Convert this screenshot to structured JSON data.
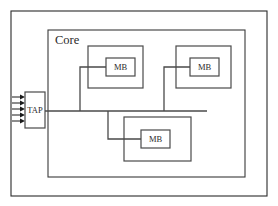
{
  "diagram": {
    "outer_frame": {
      "label": "",
      "x": 11,
      "y": 11,
      "w": 256,
      "h": 185
    },
    "core": {
      "label": "Core",
      "label_x": 55,
      "label_y": 44,
      "x": 48,
      "y": 30,
      "w": 197,
      "h": 147
    },
    "tap": {
      "label": "TAP",
      "x": 25,
      "y": 92,
      "w": 20,
      "h": 36,
      "label_x": 35,
      "label_y": 113
    },
    "bus": {
      "y": 111,
      "x_start": 45,
      "x_end": 207
    },
    "input_arrows": {
      "count": 5,
      "x_start": 12,
      "x_tip": 25,
      "ys": [
        97,
        103,
        109,
        115,
        121
      ]
    },
    "wrappers": [
      {
        "name": "wrapper-top-left",
        "x": 88,
        "y": 46,
        "w": 55,
        "h": 42,
        "mb": {
          "label": "MB",
          "x": 106,
          "y": 58,
          "w": 29,
          "h": 18
        },
        "branch": {
          "x": 80,
          "y_bus": 111,
          "y_mb": 67,
          "x_mb": 106
        }
      },
      {
        "name": "wrapper-top-right",
        "x": 176,
        "y": 46,
        "w": 55,
        "h": 42,
        "mb": {
          "label": "MB",
          "x": 190,
          "y": 58,
          "w": 29,
          "h": 18
        },
        "branch": {
          "x": 164,
          "y_bus": 111,
          "y_mb": 67,
          "x_mb": 190
        }
      },
      {
        "name": "wrapper-bottom",
        "x": 124,
        "y": 117,
        "w": 67,
        "h": 44,
        "mb": {
          "label": "MB",
          "x": 141,
          "y": 130,
          "w": 29,
          "h": 18
        },
        "branch": {
          "x": 108,
          "y_bus": 111,
          "y_mb": 139,
          "x_mb": 141
        }
      }
    ]
  }
}
